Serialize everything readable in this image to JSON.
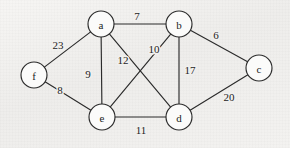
{
  "figure": {
    "kind": "undirected-weighted-graph",
    "width": 290,
    "height": 148,
    "background_color": "#f1f0ee",
    "stroke_color": "#2b2b2b",
    "node_fill_color": "#fbfbfa",
    "node_radius": 13
  },
  "nodes": [
    {
      "id": "a",
      "label": "a",
      "x": 101,
      "y": 24
    },
    {
      "id": "b",
      "label": "b",
      "x": 179,
      "y": 24
    },
    {
      "id": "c",
      "label": "c",
      "x": 259,
      "y": 68
    },
    {
      "id": "d",
      "label": "d",
      "x": 179,
      "y": 117
    },
    {
      "id": "e",
      "label": "e",
      "x": 102,
      "y": 117
    },
    {
      "id": "f",
      "label": "f",
      "x": 34,
      "y": 75
    }
  ],
  "edges": [
    {
      "id": "a-b",
      "from": "a",
      "to": "b",
      "weight": "7",
      "label_x": 137,
      "label_y": 16
    },
    {
      "id": "a-f",
      "from": "a",
      "to": "f",
      "weight": "23",
      "label_x": 58,
      "label_y": 45
    },
    {
      "id": "a-e",
      "from": "a",
      "to": "e",
      "weight": "9",
      "label_x": 88,
      "label_y": 74
    },
    {
      "id": "a-d",
      "from": "a",
      "to": "d",
      "weight": "12",
      "label_x": 123,
      "label_y": 60
    },
    {
      "id": "b-e",
      "from": "b",
      "to": "e",
      "weight": "10",
      "label_x": 154,
      "label_y": 49
    },
    {
      "id": "b-c",
      "from": "b",
      "to": "c",
      "weight": "6",
      "label_x": 216,
      "label_y": 35
    },
    {
      "id": "b-d",
      "from": "b",
      "to": "d",
      "weight": "17",
      "label_x": 190,
      "label_y": 70
    },
    {
      "id": "c-d",
      "from": "c",
      "to": "d",
      "weight": "20",
      "label_x": 229,
      "label_y": 97
    },
    {
      "id": "d-e",
      "from": "d",
      "to": "e",
      "weight": "11",
      "label_x": 141,
      "label_y": 130
    },
    {
      "id": "e-f",
      "from": "e",
      "to": "f",
      "weight": "8",
      "label_x": 60,
      "label_y": 90
    }
  ],
  "chart_data": {
    "type": "diagram",
    "title": "",
    "graph_type": "undirected weighted graph",
    "vertices": [
      "a",
      "b",
      "c",
      "d",
      "e",
      "f"
    ],
    "edge_list": [
      {
        "u": "a",
        "v": "b",
        "w": 7
      },
      {
        "u": "a",
        "v": "f",
        "w": 23
      },
      {
        "u": "a",
        "v": "e",
        "w": 9
      },
      {
        "u": "a",
        "v": "d",
        "w": 12
      },
      {
        "u": "b",
        "v": "e",
        "w": 10
      },
      {
        "u": "b",
        "v": "c",
        "w": 6
      },
      {
        "u": "b",
        "v": "d",
        "w": 17
      },
      {
        "u": "c",
        "v": "d",
        "w": 20
      },
      {
        "u": "d",
        "v": "e",
        "w": 11
      },
      {
        "u": "e",
        "v": "f",
        "w": 8
      }
    ],
    "vertex_count": 6,
    "edge_count": 10
  }
}
